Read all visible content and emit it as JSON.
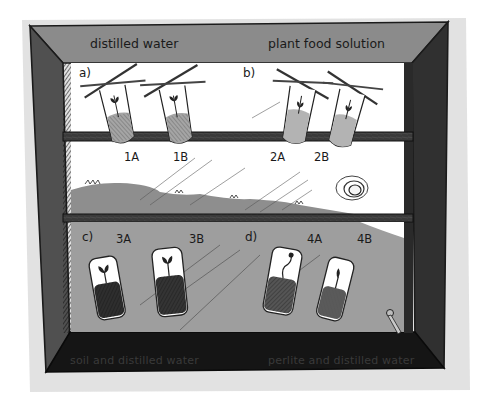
{
  "figure": {
    "frame": {
      "top_labels": {
        "left": "distilled water",
        "right": "plant food solution"
      },
      "bottom_labels": {
        "left": "soil and distilled water",
        "right": "perlite and distilled water"
      }
    },
    "sections": [
      {
        "id": "a",
        "label": "a)",
        "shelf": "top",
        "tubes": [
          {
            "id": "1A",
            "label": "1A",
            "medium": "liquid",
            "suspended_by": "crossed sticks"
          },
          {
            "id": "1B",
            "label": "1B",
            "medium": "liquid",
            "suspended_by": "crossed sticks"
          }
        ]
      },
      {
        "id": "b",
        "label": "b)",
        "shelf": "top",
        "tubes": [
          {
            "id": "2A",
            "label": "2A",
            "medium": "liquid",
            "suspended_by": "crossed sticks"
          },
          {
            "id": "2B",
            "label": "2B",
            "medium": "liquid",
            "suspended_by": "crossed sticks"
          }
        ]
      },
      {
        "id": "c",
        "label": "c)",
        "shelf": "bottom",
        "tubes": [
          {
            "id": "3A",
            "label": "3A",
            "medium": "soil"
          },
          {
            "id": "3B",
            "label": "3B",
            "medium": "soil"
          }
        ]
      },
      {
        "id": "d",
        "label": "d)",
        "shelf": "bottom",
        "tubes": [
          {
            "id": "4A",
            "label": "4A",
            "medium": "perlite"
          },
          {
            "id": "4B",
            "label": "4B",
            "medium": "perlite"
          }
        ]
      }
    ],
    "colors": {
      "frame_top": "#8a8a8a",
      "frame_sides": "#3c3c3c",
      "frame_bottom": "#141414",
      "window_bg": "#ffffff",
      "landscape": "#8e8e8e",
      "lower_pane": "#a0a0a0",
      "shelf": "#3a3a3a",
      "liquid": "#a8a8a8",
      "soil": "#2e2e2e",
      "perlite": "#4a4a4a"
    }
  }
}
